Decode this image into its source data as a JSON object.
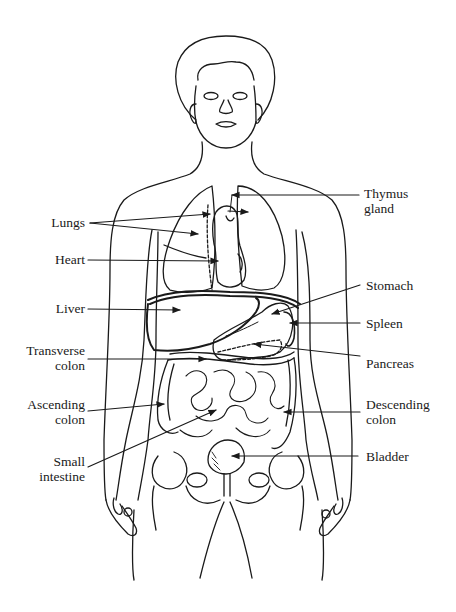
{
  "diagram": {
    "type": "anatomical-line-drawing",
    "line_color": "#1a1a1a",
    "background": "#ffffff"
  },
  "labels": {
    "left": [
      {
        "id": "lungs",
        "lines": [
          "Lungs"
        ]
      },
      {
        "id": "heart",
        "lines": [
          "Heart"
        ]
      },
      {
        "id": "liver",
        "lines": [
          "Liver"
        ]
      },
      {
        "id": "transverse_colon",
        "lines": [
          "Transverse",
          "colon"
        ]
      },
      {
        "id": "ascending_colon",
        "lines": [
          "Ascending",
          "colon"
        ]
      },
      {
        "id": "small_intestine",
        "lines": [
          "Small",
          "intestine"
        ]
      }
    ],
    "right": [
      {
        "id": "thymus_gland",
        "lines": [
          "Thymus",
          "gland"
        ]
      },
      {
        "id": "stomach",
        "lines": [
          "Stomach"
        ]
      },
      {
        "id": "spleen",
        "lines": [
          "Spleen"
        ]
      },
      {
        "id": "pancreas",
        "lines": [
          "Pancreas"
        ]
      },
      {
        "id": "descending_colon",
        "lines": [
          "Descending",
          "colon"
        ]
      },
      {
        "id": "bladder",
        "lines": [
          "Bladder"
        ]
      }
    ]
  }
}
